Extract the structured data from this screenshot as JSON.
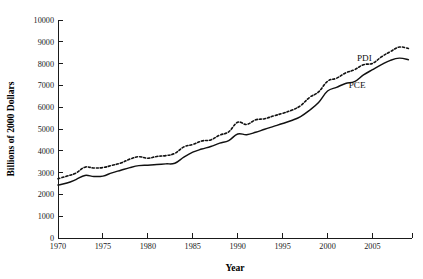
{
  "chart_data": {
    "type": "line",
    "title": "",
    "xlabel": "Year",
    "ylabel": "Billions of 2000 Dollars",
    "xlim": [
      1970,
      2009.4
    ],
    "ylim": [
      0,
      10000
    ],
    "grid": false,
    "legend_position": "inline-annotations",
    "x_ticks": [
      1970,
      1975,
      1980,
      1985,
      1990,
      1995,
      2000,
      2005
    ],
    "x_tick_labels": [
      "1970",
      "1975",
      "1980",
      "1985",
      "1990",
      "1995",
      "2000",
      "2005"
    ],
    "y_ticks": [
      0,
      1000,
      2000,
      3000,
      4000,
      5000,
      6000,
      7000,
      8000,
      9000,
      10000
    ],
    "y_tick_labels": [
      "0",
      "1000",
      "2000",
      "3000",
      "4000",
      "5000",
      "6000",
      "7000",
      "8000",
      "9000",
      "10000"
    ],
    "x": [
      1970,
      1971,
      1972,
      1973,
      1974,
      1975,
      1976,
      1977,
      1978,
      1979,
      1980,
      1981,
      1982,
      1983,
      1984,
      1985,
      1986,
      1987,
      1988,
      1989,
      1990,
      1991,
      1992,
      1993,
      1994,
      1995,
      1996,
      1997,
      1998,
      1999,
      2000,
      2001,
      2002,
      2003,
      2004,
      2005,
      2006,
      2007,
      2008,
      2009
    ],
    "series": [
      {
        "name": "PDI",
        "style": "dotted",
        "label": "PDI",
        "label_x": 2004.1,
        "label_y": 8120,
        "values": [
          2720,
          2840,
          2980,
          3250,
          3210,
          3230,
          3330,
          3440,
          3620,
          3730,
          3660,
          3740,
          3780,
          3880,
          4180,
          4290,
          4450,
          4500,
          4720,
          4870,
          5310,
          5210,
          5420,
          5470,
          5600,
          5720,
          5860,
          6070,
          6450,
          6700,
          7190,
          7330,
          7570,
          7720,
          7950,
          8010,
          8310,
          8550,
          8760,
          8690
        ]
      },
      {
        "name": "PCE",
        "style": "solid",
        "label": "PCE",
        "label_x": 2003.3,
        "label_y": 6870,
        "values": [
          2430,
          2520,
          2680,
          2870,
          2820,
          2840,
          2990,
          3110,
          3230,
          3320,
          3340,
          3370,
          3400,
          3430,
          3710,
          3940,
          4080,
          4200,
          4350,
          4470,
          4770,
          4740,
          4850,
          4990,
          5120,
          5250,
          5390,
          5570,
          5860,
          6210,
          6740,
          6910,
          7090,
          7170,
          7480,
          7720,
          7950,
          8150,
          8250,
          8180
        ]
      }
    ]
  },
  "plot_geometry": {
    "left_px": 58,
    "right_px": 412,
    "top_px": 20,
    "bottom_px": 238
  }
}
